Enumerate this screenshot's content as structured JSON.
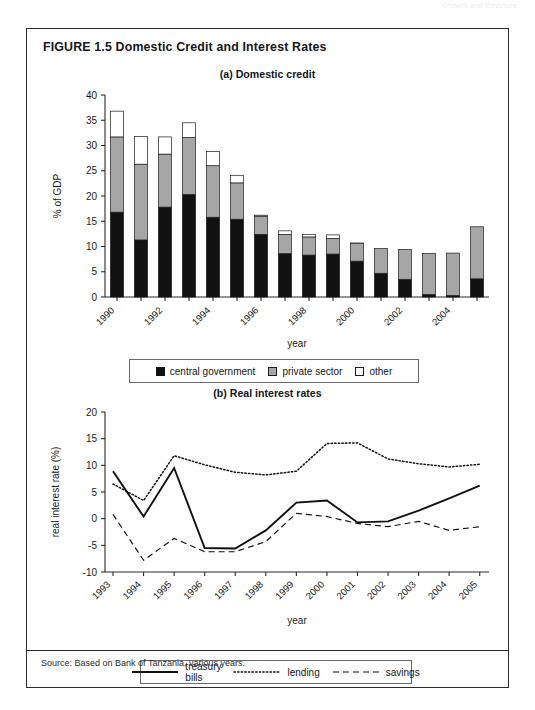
{
  "page": {
    "running_head": "Growth and Structure",
    "figure_title": "FIGURE 1.5  Domestic Credit and Interest Rates",
    "source_note": "Source: Based on Bank of Tanzania, various years."
  },
  "panel_a": {
    "title": "(a) Domestic credit",
    "legend": [
      {
        "label": "central government",
        "swatch": "sw-cg"
      },
      {
        "label": "private sector",
        "swatch": "sw-ps"
      },
      {
        "label": "other",
        "swatch": "sw-ot"
      }
    ]
  },
  "panel_b": {
    "title": "(b) Real interest rates",
    "legend": [
      {
        "label": "treasury bills",
        "style": "ln-treasury"
      },
      {
        "label": "lending",
        "style": "ln-lending"
      },
      {
        "label": "savings",
        "style": "ln-savings"
      }
    ]
  },
  "chart_data": [
    {
      "id": "domestic-credit",
      "type": "bar",
      "stacked": true,
      "title": "(a) Domestic credit",
      "xlabel": "year",
      "ylabel": "% of GDP",
      "ylim": [
        0,
        40
      ],
      "yticks": [
        0,
        5,
        10,
        15,
        20,
        25,
        30,
        35,
        40
      ],
      "grid": false,
      "legend_position": "below",
      "categories": [
        1990,
        1991,
        1992,
        1993,
        1994,
        1995,
        1996,
        1997,
        1998,
        1999,
        2000,
        2001,
        2002,
        2003,
        2004,
        2005
      ],
      "tick_labels": [
        "1990",
        "",
        "1992",
        "",
        "1994",
        "",
        "1996",
        "",
        "1998",
        "",
        "2000",
        "",
        "2002",
        "",
        "2004",
        ""
      ],
      "series": [
        {
          "name": "central government",
          "color": "#111111",
          "values": [
            16.8,
            11.3,
            17.8,
            20.3,
            15.8,
            15.4,
            12.4,
            8.6,
            8.3,
            8.5,
            7.1,
            4.7,
            3.5,
            0.5,
            0.3,
            3.6
          ]
        },
        {
          "name": "private sector",
          "color": "#a6a6a6",
          "values": [
            14.9,
            15.0,
            10.5,
            11.3,
            10.2,
            7.2,
            3.6,
            3.8,
            3.6,
            3.1,
            3.5,
            4.9,
            5.9,
            8.1,
            8.4,
            10.3
          ]
        },
        {
          "name": "other",
          "color": "#ffffff",
          "values": [
            5.1,
            5.5,
            3.4,
            2.9,
            2.8,
            1.5,
            0.2,
            0.7,
            0.5,
            0.7,
            0.1,
            0.0,
            0.0,
            0.0,
            0.0,
            0.0
          ]
        }
      ],
      "totals": [
        36.8,
        31.8,
        31.7,
        34.5,
        28.8,
        24.1,
        16.2,
        13.1,
        12.4,
        12.3,
        10.7,
        9.6,
        9.4,
        8.6,
        8.7,
        13.9
      ]
    },
    {
      "id": "real-interest-rates",
      "type": "line",
      "title": "(b) Real interest rates",
      "xlabel": "year",
      "ylabel": "real interest rate (%)",
      "ylim": [
        -10,
        20
      ],
      "yticks": [
        -10,
        -5,
        0,
        5,
        10,
        15,
        20
      ],
      "grid": false,
      "legend_position": "below",
      "x": [
        1993,
        1994,
        1995,
        1996,
        1997,
        1998,
        1999,
        2000,
        2001,
        2002,
        2003,
        2004,
        2005
      ],
      "tick_labels": [
        "1993",
        "1994",
        "1995",
        "1996",
        "1997",
        "1998",
        "1999",
        "2000",
        "2001",
        "2002",
        "2003",
        "2004",
        "2005"
      ],
      "series": [
        {
          "name": "treasury bills",
          "style": "solid",
          "values": [
            8.9,
            0.4,
            9.5,
            -5.5,
            -5.6,
            -2.2,
            3.0,
            3.4,
            -0.7,
            -0.5,
            1.5,
            3.8,
            6.2
          ]
        },
        {
          "name": "lending",
          "style": "dotted",
          "values": [
            6.5,
            3.4,
            11.8,
            10.1,
            8.7,
            8.2,
            8.9,
            14.1,
            14.2,
            11.2,
            10.3,
            9.7,
            10.2
          ]
        },
        {
          "name": "savings",
          "style": "dashed",
          "values": [
            0.8,
            -7.8,
            -3.7,
            -6.2,
            -6.2,
            -4.3,
            1.0,
            0.4,
            -0.9,
            -1.5,
            -0.5,
            -2.2,
            -1.5
          ]
        }
      ]
    }
  ]
}
